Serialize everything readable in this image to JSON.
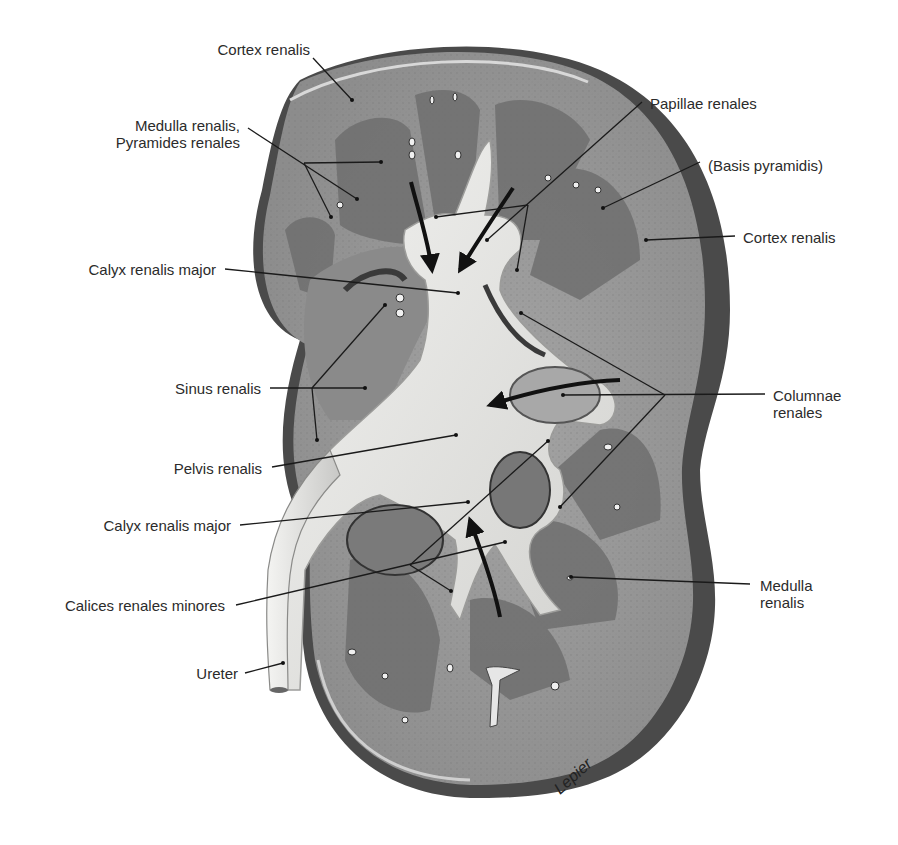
{
  "figure": {
    "colors": {
      "background": "#ffffff",
      "capsule_shadow": "#4a4a4a",
      "cortex": "#9a9a9a",
      "medulla": "#707070",
      "pelvis": "#e4e4e2",
      "sinus": "#8a8a8a",
      "leader_line": "#1a1a1a",
      "label_text": "#2b2b2b"
    }
  },
  "labels": {
    "left": [
      {
        "id": "cortex-renalis-top",
        "text": "Cortex renalis",
        "x": 200,
        "y": 49,
        "anchor": [
          352,
          100
        ]
      },
      {
        "id": "medulla-pyramides",
        "text": "Medulla renalis,\nPyramides renales",
        "x": 96,
        "y": 120,
        "anchor": [
          380,
          162
        ]
      },
      {
        "id": "calyx-major-upper",
        "text": "Calyx renalis major",
        "x": 68,
        "y": 261,
        "anchor": [
          458,
          293
        ]
      },
      {
        "id": "sinus-renalis",
        "text": "Sinus renalis",
        "x": 163,
        "y": 381,
        "anchor": [
          365,
          388
        ]
      },
      {
        "id": "pelvis-renalis",
        "text": "Pelvis renalis",
        "x": 162,
        "y": 460,
        "anchor": [
          460,
          435
        ]
      },
      {
        "id": "calyx-major-lower",
        "text": "Calyx renalis major",
        "x": 86,
        "y": 516,
        "anchor": [
          468,
          502
        ]
      },
      {
        "id": "calices-minores",
        "text": "Calices renales minores",
        "x": 44,
        "y": 596,
        "anchor": [
          505,
          542
        ]
      },
      {
        "id": "ureter",
        "text": "Ureter",
        "x": 191,
        "y": 664,
        "anchor": [
          283,
          662
        ]
      }
    ],
    "right": [
      {
        "id": "papillae-renales",
        "text": "Papillae renales",
        "x": 650,
        "y": 95,
        "anchor": [
          487,
          240
        ]
      },
      {
        "id": "basis-pyramidis",
        "text": "(Basis pyramidis)",
        "x": 708,
        "y": 157,
        "anchor": [
          603,
          208
        ]
      },
      {
        "id": "cortex-renalis-right",
        "text": "Cortex renalis",
        "x": 743,
        "y": 229,
        "anchor": [
          646,
          240
        ]
      },
      {
        "id": "columnae-renales",
        "text": "Columnae\nrenales",
        "x": 773,
        "y": 387,
        "anchor": [
          563,
          395
        ]
      },
      {
        "id": "medulla-renalis-right",
        "text": "Medulla\nrenalis",
        "x": 760,
        "y": 577,
        "anchor": [
          571,
          577
        ]
      }
    ]
  },
  "signature": "Lepier"
}
